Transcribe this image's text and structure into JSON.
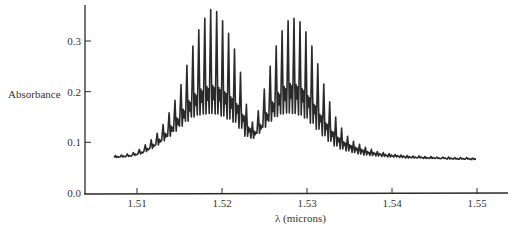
{
  "chart_data": {
    "type": "line",
    "title": "",
    "xlabel": "λ (microns)",
    "ylabel": "Absorbance",
    "xlim": [
      1.5045,
      1.5535
    ],
    "ylim": [
      0.0,
      0.36
    ],
    "xticks": [
      1.51,
      1.52,
      1.53,
      1.54,
      1.55
    ],
    "xtick_labels": [
      "1.51",
      "1.52",
      "1.53",
      "1.54",
      "1.55"
    ],
    "yticks": [
      0.0,
      0.1,
      0.2,
      0.3
    ],
    "ytick_labels": [
      "0.0",
      "0.1",
      "0.2",
      "0.3"
    ],
    "grid": false,
    "legend": null,
    "line_color": "#2a2a2a",
    "series": [
      {
        "name": "Absorbance spectrum",
        "x": [
          1.5073,
          1.508,
          1.5087,
          1.5094,
          1.5101,
          1.5108,
          1.5115,
          1.5122,
          1.5129,
          1.5136,
          1.5143,
          1.515,
          1.5157,
          1.5164,
          1.5171,
          1.5178,
          1.5185,
          1.5192,
          1.5199,
          1.5206,
          1.5213,
          1.522,
          1.5227,
          1.5234,
          1.5241,
          1.5248,
          1.5255,
          1.5262,
          1.5269,
          1.5276,
          1.5283,
          1.529,
          1.5297,
          1.5304,
          1.5311,
          1.5318,
          1.5325,
          1.5332,
          1.5339,
          1.5346,
          1.5353,
          1.536,
          1.5367,
          1.5374,
          1.5381,
          1.5388,
          1.5395,
          1.5402,
          1.5409,
          1.5416,
          1.5423,
          1.543,
          1.5437,
          1.5444,
          1.5451,
          1.5458,
          1.5465,
          1.5472,
          1.5479,
          1.5486,
          1.5493
        ],
        "peaks": [
          0.074,
          0.075,
          0.077,
          0.08,
          0.086,
          0.095,
          0.105,
          0.118,
          0.135,
          0.158,
          0.183,
          0.214,
          0.252,
          0.29,
          0.322,
          0.345,
          0.362,
          0.358,
          0.34,
          0.315,
          0.284,
          0.238,
          0.175,
          0.14,
          0.162,
          0.205,
          0.25,
          0.29,
          0.32,
          0.34,
          0.345,
          0.338,
          0.318,
          0.29,
          0.255,
          0.215,
          0.18,
          0.15,
          0.128,
          0.112,
          0.102,
          0.096,
          0.09,
          0.086,
          0.082,
          0.08,
          0.078,
          0.076,
          0.075,
          0.074,
          0.073,
          0.073,
          0.072,
          0.072,
          0.071,
          0.071,
          0.071,
          0.07,
          0.07,
          0.07,
          0.069
        ],
        "valleys": [
          0.07,
          0.071,
          0.072,
          0.074,
          0.077,
          0.082,
          0.088,
          0.095,
          0.103,
          0.112,
          0.122,
          0.132,
          0.142,
          0.15,
          0.154,
          0.156,
          0.157,
          0.156,
          0.152,
          0.146,
          0.14,
          0.128,
          0.112,
          0.108,
          0.118,
          0.13,
          0.142,
          0.151,
          0.156,
          0.158,
          0.157,
          0.154,
          0.148,
          0.138,
          0.126,
          0.113,
          0.102,
          0.093,
          0.087,
          0.083,
          0.08,
          0.077,
          0.075,
          0.074,
          0.073,
          0.072,
          0.071,
          0.071,
          0.07,
          0.069,
          0.069,
          0.069,
          0.068,
          0.068,
          0.068,
          0.068,
          0.067,
          0.067,
          0.067,
          0.067,
          0.066
        ],
        "midband": [
          0.072,
          0.073,
          0.074,
          0.077,
          0.081,
          0.088,
          0.096,
          0.106,
          0.118,
          0.132,
          0.148,
          0.165,
          0.182,
          0.196,
          0.205,
          0.21,
          0.212,
          0.208,
          0.2,
          0.19,
          0.176,
          0.155,
          0.13,
          0.122,
          0.135,
          0.158,
          0.18,
          0.198,
          0.21,
          0.216,
          0.214,
          0.206,
          0.192,
          0.175,
          0.155,
          0.138,
          0.122,
          0.11,
          0.101,
          0.095,
          0.09,
          0.086,
          0.082,
          0.08,
          0.078,
          0.076,
          0.075,
          0.074,
          0.073,
          0.072,
          0.071,
          0.071,
          0.07,
          0.07,
          0.069,
          0.069,
          0.069,
          0.068,
          0.068,
          0.068,
          0.068
        ]
      }
    ]
  }
}
